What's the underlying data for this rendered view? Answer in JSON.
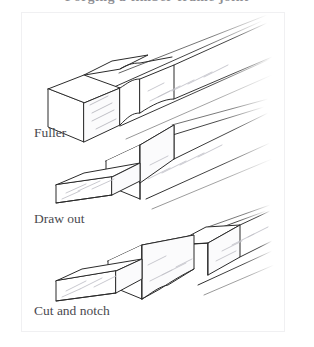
{
  "page": {
    "heading": "Forging a timber-frame joint",
    "heading_visible": "clipped"
  },
  "figure": {
    "panel_label": "blacksmithing-steps-figure",
    "background": "#ffffff",
    "border_color": "#f0f0f2",
    "line_color": "#2b2b2b",
    "shade_color": "#b9b9bf",
    "captions": [
      {
        "id": "fuller",
        "text": "Fuller"
      },
      {
        "id": "drawout",
        "text": "Draw out"
      },
      {
        "id": "cutnotch",
        "text": "Cut and notch"
      }
    ],
    "steps": [
      {
        "index": 1,
        "name": "fuller",
        "caption": "Fuller",
        "description": "Square bar with a fullered groove isometrically drawn, square end block at left, bar receding to upper right"
      },
      {
        "index": 2,
        "name": "draw-out",
        "caption": "Draw out",
        "description": "Thin drawn-out tenon projecting to the left from the end of the square bar"
      },
      {
        "index": 3,
        "name": "cut-and-notch",
        "caption": "Cut and notch",
        "description": "Drawn-out tenon with a notch cut separating two shouldered blocks along the bar"
      }
    ]
  }
}
